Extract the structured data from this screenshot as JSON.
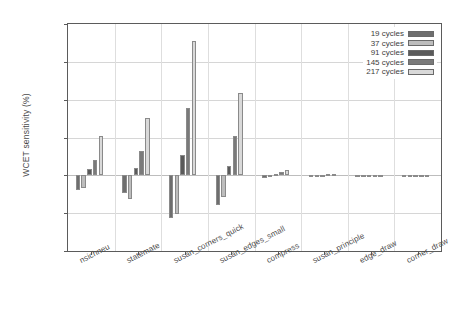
{
  "chart_data": {
    "type": "bar",
    "title": "",
    "xlabel": "",
    "ylabel": "WCET sensitivity (%)",
    "ylim": [
      -40,
      80
    ],
    "yticks": [
      -40,
      -20,
      0,
      20,
      40,
      60,
      80
    ],
    "ytick_labels": [
      "-40",
      "-20",
      "0",
      "20",
      "40",
      "60",
      "80"
    ],
    "grid": true,
    "legend_position": "top-right",
    "categories": [
      "nsichneu",
      "statemate",
      "susan_corners_quick",
      "susan_edges_small",
      "compress",
      "susan_principle",
      "edge_draw",
      "corner_draw"
    ],
    "series": [
      {
        "name": "19 cycles",
        "color": "#6e6e6e",
        "values": [
          -7.5,
          -9.5,
          -22.5,
          -15.5,
          -1.2,
          -0.4,
          -0.2,
          -0.2
        ]
      },
      {
        "name": "37 cycles",
        "color": "#bdbdbd",
        "values": [
          -6.5,
          -12.5,
          -20.5,
          -11.5,
          -0.8,
          -0.3,
          -0.2,
          -0.2
        ]
      },
      {
        "name": "91 cycles",
        "color": "#5a5a5a",
        "values": [
          3.5,
          4.0,
          10.5,
          5.0,
          0.8,
          0.3,
          -0.1,
          -0.1
        ]
      },
      {
        "name": "145 cycles",
        "color": "#7a7a7a",
        "values": [
          8.0,
          13.0,
          35.5,
          21.0,
          2.0,
          0.5,
          -0.1,
          -0.1
        ]
      },
      {
        "name": "217 cycles",
        "color": "#d9d9d9",
        "values": [
          21.0,
          30.5,
          71.0,
          43.5,
          3.0,
          0.6,
          0.0,
          0.0
        ]
      }
    ]
  }
}
